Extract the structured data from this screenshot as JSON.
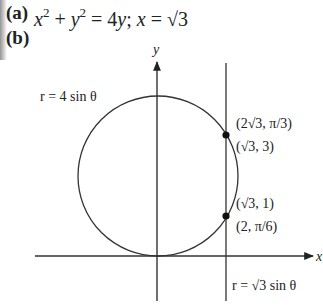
{
  "part_a": {
    "label": "(a)",
    "equation_parts": [
      "x",
      "2",
      " + ",
      "y",
      "2",
      " = 4",
      "y",
      "; ",
      "x",
      " = √3"
    ]
  },
  "part_b": {
    "label": "(b)"
  },
  "figure": {
    "x_axis_label": "x",
    "y_axis_label": "y",
    "circle_label": "r = 4 sin θ",
    "line_label": "r = √3 sin θ",
    "points": [
      {
        "polar": "(2√3, π/3)",
        "cartesian": "(√3, 3)"
      },
      {
        "cartesian": "(√3, 1)",
        "polar": "(2, π/6)"
      }
    ],
    "colors": {
      "ink": "#222222",
      "background": "#ffffff"
    }
  }
}
